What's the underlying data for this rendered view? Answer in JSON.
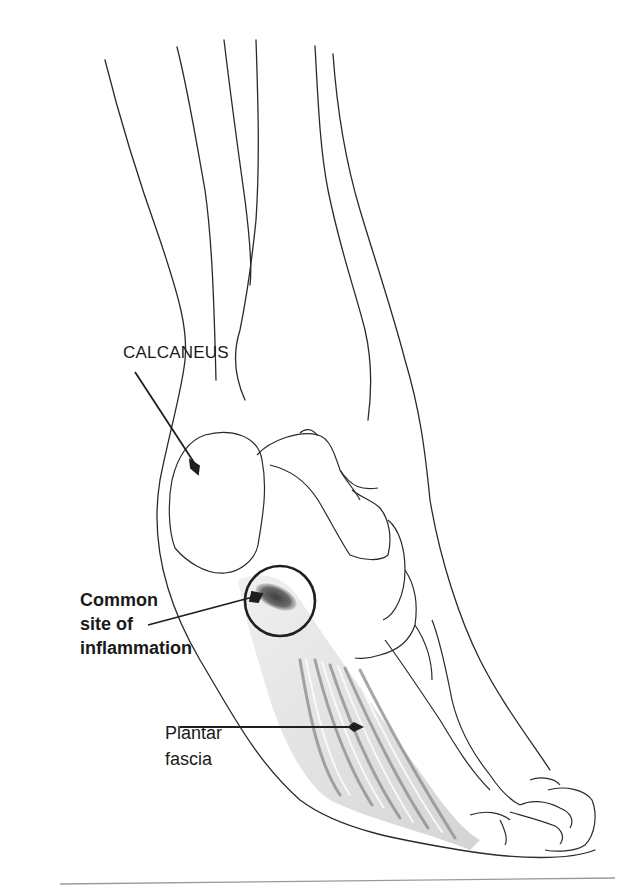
{
  "figure": {
    "colors": {
      "outline": "#2a2a2a",
      "fascia_light": "#d9d9d9",
      "fascia_dark": "#8a8a8a",
      "inflammation": "#555555",
      "background": "#ffffff"
    }
  },
  "labels": {
    "calcaneus": "CALCANEUS",
    "inflammation_site": {
      "line1": "Common",
      "line2": "site of",
      "line3": "inflammation"
    },
    "plantar_fascia": {
      "line1": "Plantar",
      "line2": "fascia"
    }
  }
}
